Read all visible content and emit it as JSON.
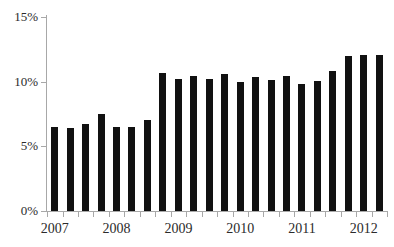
{
  "chart_data": {
    "type": "bar",
    "title": "",
    "subtitle": "",
    "xlabel": "",
    "ylabel": "",
    "ylim": [
      0,
      15
    ],
    "ytick_labels": [
      "0%",
      "5%",
      "10%",
      "15%"
    ],
    "ytick_values": [
      0,
      5,
      10,
      15
    ],
    "grid": false,
    "legend": null,
    "bar_color": "#111111",
    "axis_color": "#a8a8a8",
    "text_color": "#2b2b2b",
    "xtick_labels": [
      "2007",
      "2008",
      "2009",
      "2010",
      "2011",
      "2012"
    ],
    "xtick_label_bar_index": [
      0,
      4,
      8,
      12,
      16,
      20
    ],
    "categories": [
      "2007 Q1",
      "2007 Q2",
      "2007 Q3",
      "2007 Q4",
      "2008 Q1",
      "2008 Q2",
      "2008 Q3",
      "2008 Q4",
      "2009 Q1",
      "2009 Q2",
      "2009 Q3",
      "2009 Q4",
      "2010 Q1",
      "2010 Q2",
      "2010 Q3",
      "2010 Q4",
      "2011 Q1",
      "2011 Q2",
      "2011 Q3",
      "2011 Q4",
      "2012 Q1",
      "2012 Q2"
    ],
    "values": [
      6.5,
      6.4,
      6.7,
      7.5,
      6.5,
      6.5,
      7.0,
      10.7,
      10.2,
      10.45,
      10.2,
      10.6,
      10.0,
      10.4,
      10.1,
      10.45,
      9.85,
      10.05,
      10.8,
      12.0,
      12.05,
      12.05
    ]
  }
}
